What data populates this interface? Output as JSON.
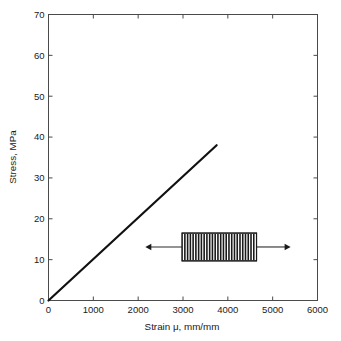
{
  "chart_data": {
    "type": "line",
    "title": "",
    "xlabel": "Strain μ, mm/mm",
    "ylabel": "Stress, MPa",
    "xlim": [
      0,
      6000
    ],
    "ylim": [
      0,
      70
    ],
    "grid": false,
    "legend": null,
    "xticks": [
      0,
      1000,
      2000,
      3000,
      4000,
      5000,
      6000
    ],
    "xtick_labels": [
      "0",
      "1000",
      "2000",
      "3000",
      "4000",
      "5000",
      "6000"
    ],
    "yticks": [
      0,
      10,
      20,
      30,
      40,
      50,
      60,
      70
    ],
    "ytick_labels": [
      "0",
      "10",
      "20",
      "30",
      "40",
      "50",
      "60",
      "70"
    ],
    "series": [
      {
        "name": "Stress-strain",
        "color": "#111111",
        "x": [
          0,
          3750
        ],
        "y": [
          0,
          38
        ]
      }
    ],
    "annotations": [
      {
        "name": "tensile-specimen",
        "kind": "hatched-rectangle-with-arrows",
        "x_range": [
          2980,
          4640
        ],
        "y_center": 13.1,
        "y_range": [
          9.7,
          16.5
        ],
        "arrow_left_x": 2160,
        "arrow_right_x": 5400,
        "hatch_count": 26,
        "fill": "#ffffff",
        "stroke": "#1a1a1a"
      }
    ]
  },
  "colors": {
    "background": "#ffffff",
    "axis": "#4a4a4a",
    "text": "#1a1a1a",
    "data": "#111111"
  }
}
